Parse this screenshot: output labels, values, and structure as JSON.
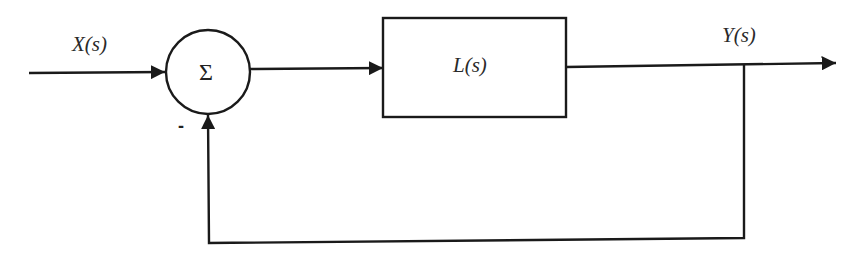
{
  "diagram": {
    "type": "feedback-control-block-diagram",
    "input_label": "X(s)",
    "output_label": "Y(s)",
    "summing_junction": {
      "symbol": "Σ",
      "feedback_sign": "-"
    },
    "block": {
      "label": "L(s)"
    },
    "colors": {
      "stroke": "#1a1a1a",
      "text": "#2a2a2a",
      "background": "#ffffff"
    }
  }
}
